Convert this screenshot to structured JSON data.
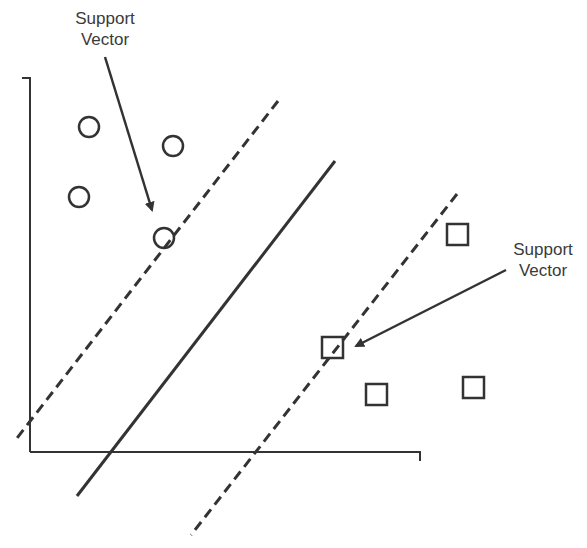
{
  "diagram": {
    "colors": {
      "ink": "#333333",
      "text": "#3a3a3a",
      "background": "#ffffff"
    },
    "labels": {
      "top_left": {
        "line1": "Support",
        "line2": "Vector"
      },
      "right": {
        "line1": "Support",
        "line2": "Vector"
      }
    },
    "axes": {
      "y_axis": {
        "x": 30,
        "top": 78,
        "bottom": 452,
        "tick_left": 22
      },
      "x_axis": {
        "y": 452,
        "left": 30,
        "right": 420,
        "tick_bottom": 461
      }
    },
    "hyperplane": {
      "style": "solid",
      "from": [
        335,
        161
      ],
      "to": [
        77,
        496
      ]
    },
    "margins": [
      {
        "name": "upper-margin",
        "style": "dashed",
        "from": [
          278,
          101
        ],
        "to": [
          14,
          442
        ]
      },
      {
        "name": "lower-margin",
        "style": "dashed",
        "from": [
          457,
          194
        ],
        "to": [
          191,
          535
        ]
      }
    ],
    "class_circles": [
      {
        "cx": 89,
        "cy": 127,
        "r": 10,
        "support_vector": false
      },
      {
        "cx": 173,
        "cy": 146,
        "r": 10,
        "support_vector": false
      },
      {
        "cx": 79,
        "cy": 197,
        "r": 10,
        "support_vector": false
      },
      {
        "cx": 164,
        "cy": 238,
        "r": 10,
        "support_vector": true
      }
    ],
    "class_squares": [
      {
        "x": 447,
        "y": 224,
        "size": 21,
        "support_vector": false
      },
      {
        "x": 322,
        "y": 337,
        "size": 21,
        "support_vector": true
      },
      {
        "x": 366,
        "y": 384,
        "size": 21,
        "support_vector": false
      },
      {
        "x": 463,
        "y": 377,
        "size": 21,
        "support_vector": false
      }
    ],
    "arrows": [
      {
        "name": "arrow-to-circle-sv",
        "from": [
          105,
          57
        ],
        "to": [
          152,
          210
        ]
      },
      {
        "name": "arrow-to-square-sv",
        "from": [
          506,
          270
        ],
        "to": [
          356,
          346
        ]
      }
    ]
  }
}
